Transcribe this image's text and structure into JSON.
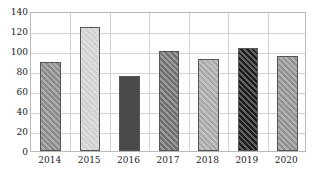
{
  "chart_data": {
    "type": "bar",
    "title": "",
    "subtitle": "",
    "xlabel": "",
    "ylabel": "",
    "categories": [
      "2014",
      "2015",
      "2016",
      "2017",
      "2018",
      "2019",
      "2020"
    ],
    "values": [
      89,
      124,
      75,
      100,
      92,
      103,
      95
    ],
    "ylim": [
      0,
      140
    ],
    "yticks": [
      0,
      20,
      40,
      60,
      80,
      100,
      120,
      140
    ],
    "ytick_labels": [
      "0",
      "20",
      "40",
      "60",
      "80",
      "100",
      "120",
      "140"
    ],
    "grid": true,
    "legend": false,
    "legend_position": "none",
    "bar_colors": [
      "#8a8a8a",
      "#d0d0d0",
      "#4a4a4a",
      "#6e6e6e",
      "#a8a8a8",
      "#1c1c1c",
      "#919191"
    ],
    "bar_hatch": [
      "diagonal",
      "diagonal",
      "solid",
      "diagonal",
      "diagonal",
      "diagonal",
      "diagonal"
    ],
    "bar_edge_color": "#555555",
    "grid_color": "#d2d2d2",
    "frame_color": "#b9b9b9",
    "background_color": "#ffffff",
    "text_color": "#1a1a1a"
  }
}
